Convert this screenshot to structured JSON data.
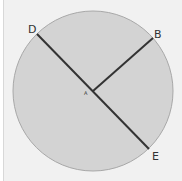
{
  "diagram": {
    "type": "circle-geometry",
    "center_label": "A",
    "points": [
      {
        "label": "D",
        "x": 37,
        "y": 34
      },
      {
        "label": "B",
        "x": 153,
        "y": 38
      },
      {
        "label": "E",
        "x": 148,
        "y": 149
      }
    ],
    "center": {
      "x": 94,
      "y": 93
    },
    "radius": 81,
    "colors": {
      "fill": "#d3d3d3",
      "stroke": "#9a9a9a",
      "line": "#333333",
      "background": "#f1f1f1"
    }
  }
}
